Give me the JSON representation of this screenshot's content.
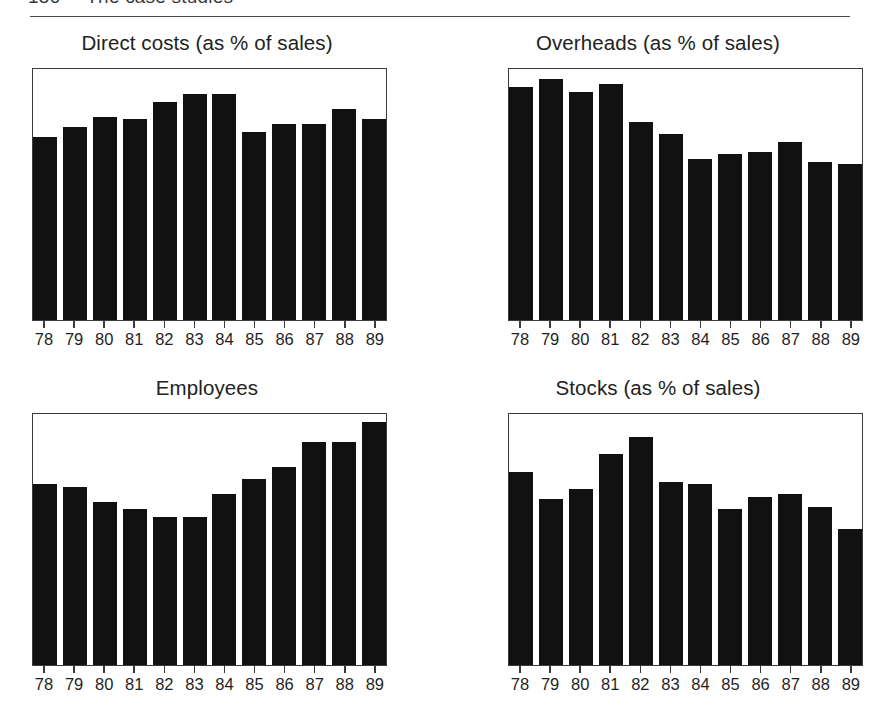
{
  "header": {
    "folio": "156",
    "running_head": "The case studies"
  },
  "panels": [
    {
      "title": "Direct costs (as % of sales)"
    },
    {
      "title": "Overheads (as % of sales)"
    },
    {
      "title": "Employees"
    },
    {
      "title": "Stocks (as % of sales)"
    }
  ],
  "chart_data": [
    {
      "type": "bar",
      "title": "Direct costs (as % of sales)",
      "xlabel": "",
      "ylabel": "",
      "categories": [
        "78",
        "79",
        "80",
        "81",
        "82",
        "83",
        "84",
        "85",
        "86",
        "87",
        "88",
        "89"
      ],
      "values": [
        73,
        77,
        81,
        80,
        87,
        90,
        90,
        75,
        78,
        78,
        84,
        80
      ],
      "ylim": [
        0,
        100
      ],
      "grid": false,
      "legend": "none",
      "bar_color": "#111111"
    },
    {
      "type": "bar",
      "title": "Overheads (as % of sales)",
      "xlabel": "",
      "ylabel": "",
      "categories": [
        "78",
        "79",
        "80",
        "81",
        "82",
        "83",
        "84",
        "85",
        "86",
        "87",
        "88",
        "89"
      ],
      "values": [
        93,
        96,
        91,
        94,
        79,
        74,
        64,
        66,
        67,
        71,
        63,
        62
      ],
      "ylim": [
        0,
        100
      ],
      "grid": false,
      "legend": "none",
      "bar_color": "#111111"
    },
    {
      "type": "bar",
      "title": "Employees",
      "xlabel": "",
      "ylabel": "",
      "categories": [
        "78",
        "79",
        "80",
        "81",
        "82",
        "83",
        "84",
        "85",
        "86",
        "87",
        "88",
        "89"
      ],
      "values": [
        72,
        71,
        65,
        62,
        59,
        59,
        68,
        74,
        79,
        89,
        89,
        97
      ],
      "ylim": [
        0,
        100
      ],
      "grid": false,
      "legend": "none",
      "bar_color": "#111111"
    },
    {
      "type": "bar",
      "title": "Stocks (as % of sales)",
      "xlabel": "",
      "ylabel": "",
      "categories": [
        "78",
        "79",
        "80",
        "81",
        "82",
        "83",
        "84",
        "85",
        "86",
        "87",
        "88",
        "89"
      ],
      "values": [
        77,
        66,
        70,
        84,
        91,
        73,
        72,
        62,
        67,
        68,
        63,
        54
      ],
      "ylim": [
        0,
        100
      ],
      "grid": false,
      "legend": "none",
      "bar_color": "#111111"
    }
  ]
}
